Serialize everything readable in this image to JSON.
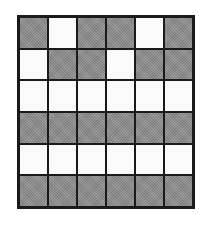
{
  "grid": {
    "rows": 6,
    "cols": 6,
    "colors": {
      "G": "#8f8f8f",
      "W": "#fbfbfb",
      "border": "#1a1a1a"
    },
    "cells": [
      [
        "G",
        "W",
        "G",
        "G",
        "W",
        "G"
      ],
      [
        "W",
        "G",
        "G",
        "W",
        "G",
        "G"
      ],
      [
        "W",
        "W",
        "W",
        "W",
        "W",
        "W"
      ],
      [
        "G",
        "G",
        "G",
        "G",
        "G",
        "G"
      ],
      [
        "W",
        "W",
        "W",
        "W",
        "W",
        "W"
      ],
      [
        "G",
        "G",
        "G",
        "G",
        "G",
        "G"
      ]
    ]
  }
}
